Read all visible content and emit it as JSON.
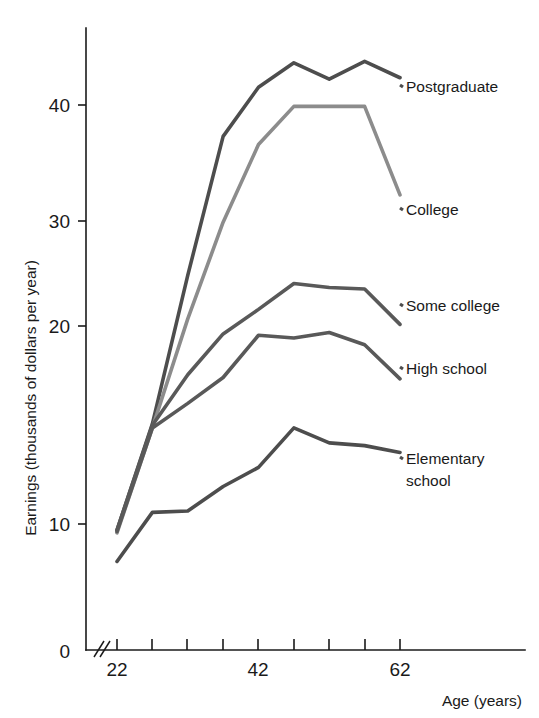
{
  "chart_data": {
    "type": "line",
    "title": "",
    "xlabel": "Age (years)",
    "ylabel": "Earnings (thousands of dollars per year)",
    "xlim": [
      22,
      67
    ],
    "ylim": [
      0,
      46
    ],
    "grid": false,
    "legend_position": "right-inline-labels",
    "axis_break": "x-axis break between origin and 22",
    "x": [
      22,
      27,
      32,
      37,
      42,
      47,
      52,
      57,
      62
    ],
    "xticks": [
      22,
      27,
      32,
      37,
      42,
      47,
      52,
      57,
      62
    ],
    "xtick_labels": [
      "22",
      "",
      "",
      "",
      "42",
      "",
      "",
      "",
      "62"
    ],
    "yticks": [
      0,
      10,
      20,
      30,
      40
    ],
    "ytick_labels": [
      "0",
      "10",
      "20",
      "30",
      "40"
    ],
    "series": [
      {
        "name": "Postgraduate",
        "color": "#4d4d4d",
        "values": [
          8.8,
          16.6,
          27.5,
          37.7,
          41.3,
          43.1,
          41.9,
          43.2,
          42.0
        ]
      },
      {
        "name": "College",
        "color": "#8c8c8c",
        "values": [
          8.6,
          16.3,
          24.3,
          31.4,
          37.1,
          39.9,
          39.9,
          39.9,
          33.4
        ]
      },
      {
        "name": "Some college",
        "color": "#595959",
        "values": [
          8.8,
          16.5,
          20.2,
          23.2,
          25.0,
          26.9,
          26.6,
          26.5,
          23.9
        ]
      },
      {
        "name": "High school",
        "color": "#595959",
        "values": [
          8.7,
          16.3,
          18.1,
          20.0,
          23.1,
          22.9,
          23.3,
          22.4,
          19.9
        ]
      },
      {
        "name": "Elementary school",
        "color": "#4d4d4d",
        "values": [
          6.5,
          10.1,
          10.2,
          12.0,
          13.4,
          16.3,
          15.2,
          15.0,
          14.5
        ]
      }
    ],
    "series_labels": [
      {
        "text": "Postgraduate",
        "line_index": 0
      },
      {
        "text": "College",
        "line_index": 1
      },
      {
        "text": "Some college",
        "line_index": 2
      },
      {
        "text": "High school",
        "line_index": 3
      },
      {
        "text": "Elementary",
        "line_index": 4
      },
      {
        "text": "school",
        "line_index": 4
      }
    ]
  },
  "labels": {
    "y_axis_title": "Earnings (thousands of dollars per year)",
    "x_axis_title": "Age (years)",
    "y_0": "0",
    "y_10": "10",
    "y_20": "20",
    "y_30": "30",
    "y_40": "40",
    "x_22": "22",
    "x_42": "42",
    "x_62": "62",
    "s_postgraduate": "Postgraduate",
    "s_college": "College",
    "s_some_college": "Some college",
    "s_high_school": "High school",
    "s_elementary_1": "Elementary",
    "s_elementary_2": "school"
  }
}
